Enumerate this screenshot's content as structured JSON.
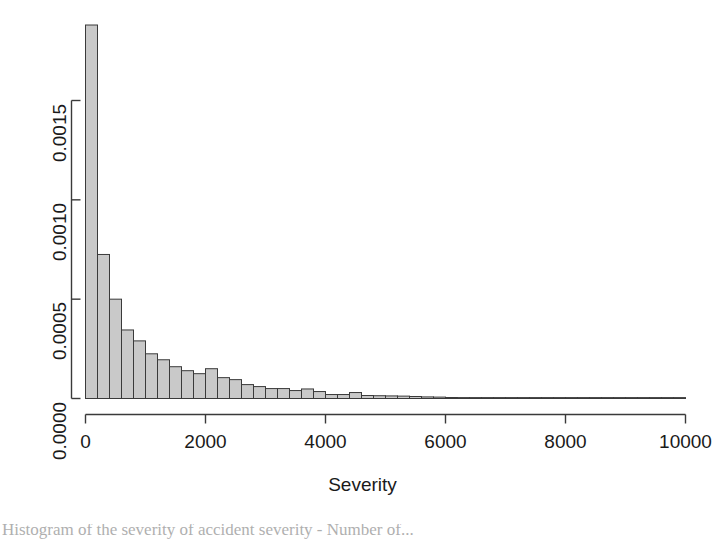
{
  "figure": {
    "xlabel": "Severity",
    "ylabel": "",
    "title": "",
    "caption": "Histogram of the severity of accident severity - Number of..."
  },
  "axes": {
    "x_ticks": [
      "0",
      "2000",
      "4000",
      "6000",
      "8000",
      "10000"
    ],
    "x_tick_values": [
      0,
      2000,
      4000,
      6000,
      8000,
      10000
    ],
    "y_ticks": [
      "0.0000",
      "0.0005",
      "0.0010",
      "0.0015"
    ],
    "y_tick_values": [
      0.0,
      0.0005,
      0.001,
      0.0015
    ]
  },
  "style": {
    "bar_fill": "#c9c9c9",
    "bar_border": "#3a3a3a",
    "axis_color": "#3a3a3a",
    "text_color": "#1a1a1a",
    "background": "#ffffff"
  },
  "chart_data": {
    "type": "bar",
    "title": "",
    "xlabel": "Severity",
    "ylabel": "Density",
    "xlim": [
      0,
      10000
    ],
    "ylim": [
      0,
      0.00188
    ],
    "grid": false,
    "legend": "none",
    "bin_width": 200,
    "categories": [
      "0-200",
      "200-400",
      "400-600",
      "600-800",
      "800-1000",
      "1000-1200",
      "1200-1400",
      "1400-1600",
      "1600-1800",
      "1800-2000",
      "2000-2200",
      "2200-2400",
      "2400-2600",
      "2600-2800",
      "2800-3000",
      "3000-3200",
      "3200-3400",
      "3400-3600",
      "3600-3800",
      "3800-4000",
      "4000-4200",
      "4200-4400",
      "4400-4600",
      "4600-4800",
      "4800-5000",
      "5000-5200",
      "5200-5400",
      "5400-5600",
      "5600-5800",
      "5800-6000",
      "6000-6200",
      "6200-6400",
      "6400-6600",
      "6600-6800",
      "6800-7000",
      "7000-7200",
      "7200-7400",
      "7400-7600",
      "7600-7800",
      "7800-8000",
      "8000-8200",
      "8200-8400",
      "8400-8600",
      "8600-8800",
      "8800-9000",
      "9000-9200",
      "9200-9400",
      "9400-9600",
      "9600-9800",
      "9800-10000"
    ],
    "bin_starts": [
      0,
      200,
      400,
      600,
      800,
      1000,
      1200,
      1400,
      1600,
      1800,
      2000,
      2200,
      2400,
      2600,
      2800,
      3000,
      3200,
      3400,
      3600,
      3800,
      4000,
      4200,
      4400,
      4600,
      4800,
      5000,
      5200,
      5400,
      5600,
      5800,
      6000,
      6200,
      6400,
      6600,
      6800,
      7000,
      7200,
      7400,
      7600,
      7800,
      8000,
      8200,
      8400,
      8600,
      8800,
      9000,
      9200,
      9400,
      9600,
      9800
    ],
    "values": [
      0.00188,
      0.000725,
      0.0005,
      0.000345,
      0.00029,
      0.000225,
      0.000195,
      0.00016,
      0.00014,
      0.000125,
      0.00015,
      0.000105,
      9.5e-05,
      7e-05,
      6e-05,
      5e-05,
      5e-05,
      4e-05,
      4.8e-05,
      3.5e-05,
      2e-05,
      2e-05,
      3e-05,
      1.5e-05,
      1.4e-05,
      1.3e-05,
      1.2e-05,
      1e-05,
      8e-06,
      7e-06,
      5e-06,
      4e-06,
      4e-06,
      3e-06,
      3e-06,
      2e-06,
      2e-06,
      2e-06,
      2e-06,
      2e-06,
      2e-06,
      4e-06,
      4e-06,
      2e-06,
      1e-06,
      1e-06,
      1e-06,
      1e-06,
      1e-06,
      1e-06
    ],
    "ylabel_ticks": [
      "0.0000",
      "0.0005",
      "0.0010",
      "0.0015"
    ]
  }
}
